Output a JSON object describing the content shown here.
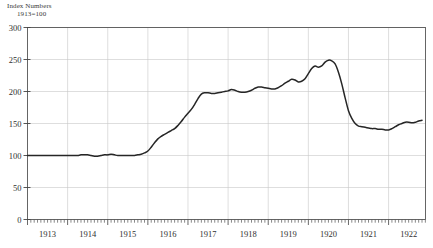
{
  "chart_data": {
    "type": "line",
    "title": "Index Numbers",
    "subtitle": "1913=100",
    "xlabel": "",
    "ylabel": "Index Numbers",
    "ylim": [
      0,
      300
    ],
    "xlim": [
      1913.0,
      1922.92
    ],
    "y_ticks": [
      0,
      50,
      100,
      150,
      200,
      250,
      300
    ],
    "x_ticks": [
      1913,
      1914,
      1915,
      1916,
      1917,
      1918,
      1919,
      1920,
      1921,
      1922
    ],
    "grid": "vertical-year-lines-and-horizontal-value-lines",
    "legend": "none",
    "line_color": "#262626",
    "grid_color": "#c8c8c8",
    "frame_color": "#555555",
    "minor_tick_interval": "monthly",
    "series": [
      {
        "name": "Wholesale Price Index",
        "x": [
          1913.0,
          1913.083,
          1913.167,
          1913.25,
          1913.333,
          1913.417,
          1913.5,
          1913.583,
          1913.667,
          1913.75,
          1913.833,
          1913.917,
          1914.0,
          1914.083,
          1914.167,
          1914.25,
          1914.333,
          1914.417,
          1914.5,
          1914.583,
          1914.667,
          1914.75,
          1914.833,
          1914.917,
          1915.0,
          1915.083,
          1915.167,
          1915.25,
          1915.333,
          1915.417,
          1915.5,
          1915.583,
          1915.667,
          1915.75,
          1915.833,
          1915.917,
          1916.0,
          1916.083,
          1916.167,
          1916.25,
          1916.333,
          1916.417,
          1916.5,
          1916.583,
          1916.667,
          1916.75,
          1916.833,
          1916.917,
          1917.0,
          1917.083,
          1917.167,
          1917.25,
          1917.333,
          1917.417,
          1917.5,
          1917.583,
          1917.667,
          1917.75,
          1917.833,
          1917.917,
          1918.0,
          1918.083,
          1918.167,
          1918.25,
          1918.333,
          1918.417,
          1918.5,
          1918.583,
          1918.667,
          1918.75,
          1918.833,
          1918.917,
          1919.0,
          1919.083,
          1919.167,
          1919.25,
          1919.333,
          1919.417,
          1919.5,
          1919.583,
          1919.667,
          1919.75,
          1919.833,
          1919.917,
          1920.0,
          1920.083,
          1920.167,
          1920.25,
          1920.333,
          1920.417,
          1920.5,
          1920.583,
          1920.667,
          1920.75,
          1920.833,
          1920.917,
          1921.0,
          1921.083,
          1921.167,
          1921.25,
          1921.333,
          1921.417,
          1921.5,
          1921.583,
          1921.667,
          1921.75,
          1921.833,
          1921.917,
          1922.0,
          1922.083,
          1922.167,
          1922.25,
          1922.333,
          1922.417,
          1922.5,
          1922.583,
          1922.667,
          1922.75,
          1922.833
        ],
        "values": [
          100,
          100,
          100,
          100,
          100,
          100,
          100,
          100,
          100,
          100,
          100,
          100,
          100,
          100,
          100,
          100,
          101,
          101,
          101,
          100,
          99,
          99,
          100,
          101,
          101,
          102,
          101,
          100,
          100,
          100,
          100,
          100,
          100,
          101,
          102,
          104,
          107,
          113,
          120,
          126,
          130,
          133,
          136,
          139,
          142,
          147,
          153,
          160,
          166,
          172,
          180,
          189,
          196,
          198,
          198,
          197,
          197,
          198,
          199,
          200,
          201,
          203,
          202,
          200,
          199,
          199,
          200,
          202,
          205,
          207,
          207,
          206,
          205,
          204,
          204,
          206,
          209,
          213,
          216,
          219,
          218,
          215,
          216,
          220,
          228,
          236,
          240,
          238,
          240,
          246,
          249,
          248,
          243,
          230,
          212,
          190,
          170,
          158,
          150,
          146,
          145,
          144,
          143,
          142,
          142,
          141,
          141,
          140,
          140,
          142,
          145,
          148,
          150,
          152,
          152,
          151,
          152,
          154,
          155
        ]
      }
    ]
  },
  "axis": {
    "title_line1": "Index Numbers",
    "title_line2": "1913=100",
    "y_labels": [
      "300",
      "250",
      "200",
      "150",
      "100",
      "50",
      "0"
    ],
    "x_labels": [
      "1913",
      "1914",
      "1915",
      "1916",
      "1917",
      "1918",
      "1919",
      "1920",
      "1921",
      "1922"
    ]
  }
}
